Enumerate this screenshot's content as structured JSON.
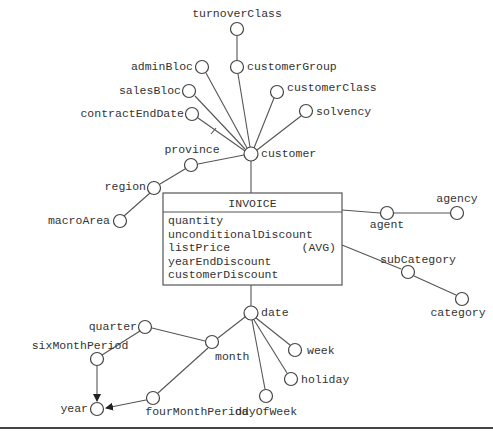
{
  "diagram": {
    "fact": {
      "name": "INVOICE",
      "measures": [
        {
          "name": "quantity",
          "aggregation": ""
        },
        {
          "name": "unconditionalDiscount",
          "aggregation": ""
        },
        {
          "name": "listPrice",
          "aggregation": "(AVG)"
        },
        {
          "name": "yearEndDiscount",
          "aggregation": ""
        },
        {
          "name": "customerDiscount",
          "aggregation": ""
        }
      ]
    },
    "nodes": {
      "turnoverClass": "turnoverClass",
      "customerGroup": "customerGroup",
      "adminBloc": "adminBloc",
      "salesBloc": "salesBloc",
      "contractEndDate": "contractEndDate",
      "customerClass": "customerClass",
      "solvency": "solvency",
      "customer": "customer",
      "province": "province",
      "region": "region",
      "macroArea": "macroArea",
      "agent": "agent",
      "agency": "agency",
      "subCategory": "subCategory",
      "category": "category",
      "date": "date",
      "week": "week",
      "holiday": "holiday",
      "dayOfWeek": "dayOfWeek",
      "month": "month",
      "quarter": "quarter",
      "sixMonthPeriod": "sixMonthPeriod",
      "fourMonthPeriod": "fourMonthPeriod",
      "year": "year"
    },
    "edges": [
      [
        "INVOICE",
        "customer"
      ],
      [
        "customer",
        "customerGroup"
      ],
      [
        "customerGroup",
        "turnoverClass"
      ],
      [
        "customer",
        "adminBloc"
      ],
      [
        "customer",
        "salesBloc"
      ],
      [
        "customer",
        "contractEndDate (optional)"
      ],
      [
        "customer",
        "customerClass"
      ],
      [
        "customer",
        "solvency"
      ],
      [
        "customer",
        "province"
      ],
      [
        "province",
        "region"
      ],
      [
        "region",
        "macroArea"
      ],
      [
        "INVOICE",
        "agent"
      ],
      [
        "agent",
        "agency"
      ],
      [
        "INVOICE",
        "subCategory"
      ],
      [
        "subCategory",
        "category"
      ],
      [
        "INVOICE",
        "date"
      ],
      [
        "date",
        "week"
      ],
      [
        "date",
        "holiday"
      ],
      [
        "date",
        "dayOfWeek"
      ],
      [
        "date",
        "month"
      ],
      [
        "month",
        "quarter"
      ],
      [
        "quarter",
        "sixMonthPeriod"
      ],
      [
        "sixMonthPeriod",
        "year"
      ],
      [
        "month",
        "fourMonthPeriod"
      ],
      [
        "fourMonthPeriod",
        "year"
      ]
    ],
    "colors": {
      "line": "#555555",
      "text": "#333333",
      "background": "#ffffff"
    }
  }
}
